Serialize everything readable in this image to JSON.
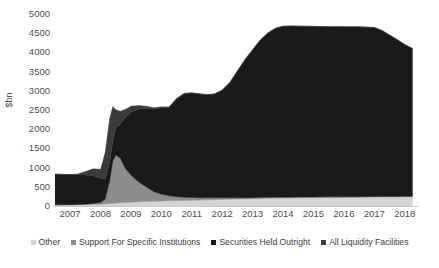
{
  "chart_data": {
    "type": "area",
    "stacked": true,
    "title": "",
    "subtitle": "",
    "xlabel": "",
    "ylabel": "$bn",
    "ylim": [
      0,
      5000
    ],
    "ytick_values": [
      0,
      500,
      1000,
      1500,
      2000,
      2500,
      3000,
      3500,
      4000,
      4500,
      5000
    ],
    "ytick_labels": [
      "0",
      "500",
      "1000",
      "1500",
      "2000",
      "2500",
      "3000",
      "3500",
      "4000",
      "4500",
      "5000"
    ],
    "xlim": [
      2007.0,
      2018.9
    ],
    "xtick_labels": [
      "2007",
      "2008",
      "2009",
      "2010",
      "2011",
      "2012",
      "2013",
      "2014",
      "2015",
      "2016",
      "2017",
      "2018"
    ],
    "xtick_values": [
      2007,
      2008,
      2009,
      2010,
      2011,
      2012,
      2013,
      2014,
      2015,
      2016,
      2017,
      2018
    ],
    "grid": false,
    "legend_position": "bottom",
    "x": [
      2007.0,
      2007.25,
      2007.5,
      2007.75,
      2008.0,
      2008.25,
      2008.5,
      2008.65,
      2008.8,
      2008.9,
      2009.0,
      2009.15,
      2009.3,
      2009.5,
      2009.75,
      2010.0,
      2010.25,
      2010.5,
      2010.75,
      2011.0,
      2011.25,
      2011.5,
      2011.75,
      2012.0,
      2012.25,
      2012.5,
      2012.75,
      2013.0,
      2013.25,
      2013.5,
      2013.75,
      2014.0,
      2014.25,
      2014.5,
      2014.75,
      2015.0,
      2015.5,
      2016.0,
      2016.5,
      2017.0,
      2017.5,
      2017.75,
      2018.0,
      2018.25,
      2018.5,
      2018.75
    ],
    "series": [
      {
        "name": "Other",
        "color": "#d4d4d4",
        "values": [
          30,
          32,
          34,
          36,
          38,
          42,
          48,
          55,
          62,
          70,
          78,
          85,
          92,
          100,
          108,
          115,
          122,
          128,
          134,
          140,
          145,
          150,
          155,
          160,
          165,
          170,
          175,
          180,
          185,
          190,
          195,
          200,
          203,
          206,
          209,
          212,
          216,
          220,
          224,
          228,
          232,
          234,
          236,
          238,
          240,
          242
        ]
      },
      {
        "name": "Support For Specific Institutions",
        "color": "#8c8c8c",
        "values": [
          0,
          0,
          0,
          0,
          10,
          25,
          40,
          120,
          600,
          1100,
          1250,
          1150,
          900,
          700,
          520,
          380,
          250,
          180,
          130,
          100,
          80,
          70,
          60,
          55,
          50,
          45,
          40,
          35,
          30,
          28,
          26,
          25,
          24,
          23,
          22,
          21,
          20,
          18,
          17,
          16,
          15,
          14,
          13,
          12,
          11,
          10
        ]
      },
      {
        "name": "Securities Held Outright",
        "color": "#1a1a1a",
        "values": [
          800,
          790,
          785,
          780,
          760,
          720,
          640,
          520,
          480,
          520,
          700,
          900,
          1300,
          1650,
          1900,
          2050,
          2150,
          2250,
          2300,
          2550,
          2700,
          2720,
          2700,
          2680,
          2700,
          2800,
          3000,
          3300,
          3600,
          3850,
          4100,
          4280,
          4400,
          4450,
          4455,
          4450,
          4440,
          4430,
          4425,
          4420,
          4400,
          4320,
          4200,
          4080,
          3950,
          3850
        ]
      },
      {
        "name": "All Liquidity Facilities",
        "color": "#3b3b3b",
        "values": [
          0,
          0,
          5,
          15,
          90,
          180,
          230,
          700,
          1150,
          900,
          480,
          330,
          220,
          150,
          90,
          55,
          35,
          25,
          18,
          14,
          12,
          10,
          9,
          8,
          7,
          6,
          6,
          5,
          5,
          4,
          4,
          4,
          3,
          3,
          3,
          3,
          3,
          2,
          2,
          2,
          2,
          2,
          2,
          2,
          2,
          2
        ]
      }
    ]
  },
  "axes": {
    "y_title": "$bn"
  },
  "legend": {
    "items": [
      {
        "label": "Other",
        "color": "#d4d4d4"
      },
      {
        "label": "Support For Specific Institutions",
        "color": "#8c8c8c"
      },
      {
        "label": "Securities Held Outright",
        "color": "#161616"
      },
      {
        "label": "All Liquidity Facilities",
        "color": "#3b3b3b"
      }
    ]
  }
}
